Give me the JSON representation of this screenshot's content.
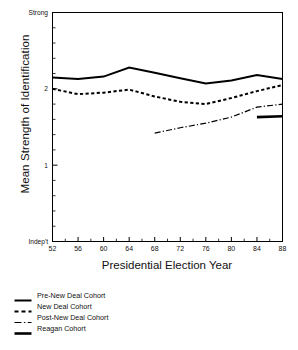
{
  "chart_data": {
    "type": "line",
    "title": "",
    "xlabel": "Presidential Election Year",
    "ylabel": "Mean Strength of Identification",
    "xlim": [
      52,
      88
    ],
    "ylim": [
      0,
      3
    ],
    "grid": false,
    "legend_position": "below-left",
    "x_tick_labels": [
      "52",
      "56",
      "60",
      "64",
      "68",
      "72",
      "76",
      "80",
      "84",
      "88"
    ],
    "x_tick_values": [
      52,
      56,
      60,
      64,
      68,
      72,
      76,
      80,
      84,
      88
    ],
    "x_minor_tick_values": [
      54,
      58,
      62,
      66,
      70,
      74,
      78,
      82,
      86
    ],
    "y_tick_labels": [
      "Indep't",
      "1",
      "2",
      "Strong"
    ],
    "y_tick_values": [
      0,
      1,
      2,
      3
    ],
    "y_minor_tick_values": [
      0.2,
      0.4,
      0.6,
      0.8,
      1.2,
      1.4,
      1.6,
      1.8,
      2.2,
      2.4,
      2.6,
      2.8
    ],
    "series": [
      {
        "name": "Pre-New Deal Cohort",
        "style": "solid",
        "width": 2.0,
        "color": "#000000",
        "x": [
          52,
          56,
          60,
          64,
          68,
          72,
          76,
          80,
          84,
          88
        ],
        "values": [
          2.15,
          2.13,
          2.16,
          2.28,
          2.21,
          2.14,
          2.07,
          2.11,
          2.18,
          2.13
        ]
      },
      {
        "name": "New Deal Cohort",
        "style": "dashed",
        "width": 2.0,
        "color": "#000000",
        "x": [
          52,
          56,
          60,
          64,
          68,
          72,
          76,
          80,
          84,
          88
        ],
        "values": [
          2.0,
          1.93,
          1.95,
          1.99,
          1.9,
          1.83,
          1.8,
          1.88,
          1.97,
          2.05
        ]
      },
      {
        "name": "Post-New Deal Cohort",
        "style": "dash-dot",
        "width": 1.2,
        "color": "#000000",
        "x": [
          68,
          72,
          76,
          80,
          84,
          88
        ],
        "values": [
          1.42,
          1.49,
          1.55,
          1.63,
          1.76,
          1.8
        ]
      },
      {
        "name": "Reagan Cohort",
        "style": "solid",
        "width": 2.6,
        "color": "#000000",
        "x": [
          84,
          88
        ],
        "values": [
          1.63,
          1.64
        ]
      }
    ]
  },
  "legend": {
    "items": [
      {
        "label": "Pre-New Deal Cohort",
        "swatch": "solid-line-icon"
      },
      {
        "label": "New Deal Cohort",
        "swatch": "dashed-line-icon"
      },
      {
        "label": "Post-New Deal Cohort",
        "swatch": "dash-dot-line-icon"
      },
      {
        "label": "Reagan Cohort",
        "swatch": "thick-solid-line-icon"
      }
    ]
  },
  "colors": {
    "ink": "#000000",
    "background": "#ffffff"
  }
}
